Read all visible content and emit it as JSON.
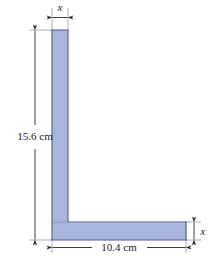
{
  "figure": {
    "type": "engineering-dimension-diagram",
    "shape_name": "L-shaped flat plate",
    "background_color": "#ffffff",
    "shape": {
      "fill_color": "#a9b5dd",
      "stroke_color": "#4a5a9a",
      "seam_color": "#8a97c4",
      "vertical_arm": {
        "left_px": 52,
        "right_px": 68,
        "top_px": 30,
        "bottom_px": 240
      },
      "horizontal_arm": {
        "left_px": 52,
        "right_px": 186,
        "top_px": 222,
        "bottom_px": 240
      }
    },
    "dimensions": [
      {
        "id": "top-width",
        "label": "x",
        "italic": true,
        "orientation": "horizontal",
        "position": "top",
        "measures": "vertical arm thickness"
      },
      {
        "id": "left-height",
        "label": "15.6 cm",
        "italic": false,
        "orientation": "vertical",
        "position": "left",
        "measures": "overall height",
        "value": 15.6,
        "unit": "cm"
      },
      {
        "id": "bottom-width",
        "label": "10.4 cm",
        "italic": false,
        "orientation": "horizontal",
        "position": "bottom",
        "measures": "overall width",
        "value": 10.4,
        "unit": "cm"
      },
      {
        "id": "right-thickness",
        "label": "x",
        "italic": true,
        "orientation": "vertical",
        "position": "right",
        "measures": "horizontal arm thickness"
      }
    ],
    "line_color": "#2a2a2a",
    "extension_line_color": "#8c8c8c"
  },
  "caption": {
    "text": "",
    "note": "faint clipped caption strip at bottom edge"
  }
}
